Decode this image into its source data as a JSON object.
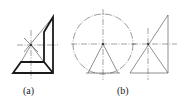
{
  "figure": {
    "panels": [
      {
        "id": "a",
        "label": "(a)"
      },
      {
        "id": "b",
        "label": "(b)"
      }
    ]
  },
  "colors": {
    "line": "#1a1a1a",
    "construction": "#555555",
    "background": "#ffffff"
  }
}
